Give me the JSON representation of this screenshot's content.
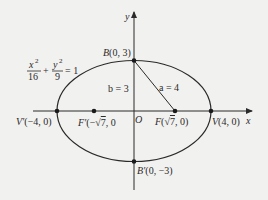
{
  "diagram": {
    "type": "ellipse-with-foci",
    "equation": {
      "x_num": "x",
      "x_exp": "2",
      "x_den": "16",
      "plus": "+",
      "y_num": "y",
      "y_exp": "2",
      "y_den": "9",
      "rhs": "= 1"
    },
    "axes": {
      "x_label": "x",
      "y_label": "y",
      "origin_label": "O"
    },
    "points": {
      "B": {
        "name": "B",
        "coords": "(0, 3)"
      },
      "B_prime": {
        "name": "B′",
        "coords": "(0, −3)"
      },
      "V": {
        "name": "V",
        "coords": "(4, 0)"
      },
      "V_prime": {
        "name": "V′",
        "coords": "(−4, 0)"
      },
      "F": {
        "name": "F",
        "pre": "(",
        "sqrt": "√",
        "radicand": "7",
        "post": ", 0)"
      },
      "F_prime": {
        "name": "F′",
        "pre": "(−",
        "sqrt": "√",
        "radicand": "7",
        "post": ", 0"
      }
    },
    "segments": {
      "b_label": "b = 3",
      "a_label": "a = 4"
    },
    "colors": {
      "stroke": "#2a2a2a",
      "background": "#f1f1ef"
    }
  }
}
